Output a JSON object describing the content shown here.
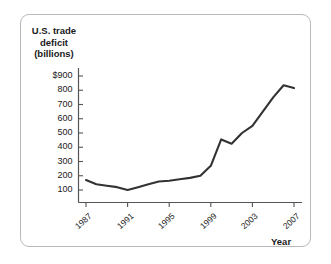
{
  "figure": {
    "border_color": "#b9b9b9",
    "background": "#ffffff",
    "line_color": "#333333",
    "axis_color": "#555555"
  },
  "axis_titles": {
    "y_line1": "U.S. trade",
    "y_line2": "deficit",
    "y_line3": "(billions)",
    "x": "Year"
  },
  "chart_data": {
    "type": "line",
    "title": "",
    "subtitle": "",
    "xlabel": "Year",
    "ylabel": "U.S. trade deficit (billions)",
    "xlim": [
      1986,
      2008
    ],
    "ylim": [
      0,
      950
    ],
    "grid": false,
    "legend": null,
    "x_tick_labels": [
      "1987",
      "1991",
      "1995",
      "1999",
      "2003",
      "2007"
    ],
    "x_tick_values": [
      1987,
      1991,
      1995,
      1999,
      2003,
      2007
    ],
    "y_tick_labels": [
      "$900",
      "800",
      "700",
      "600",
      "500",
      "400",
      "300",
      "200",
      "100"
    ],
    "y_tick_values": [
      900,
      800,
      700,
      600,
      500,
      400,
      300,
      200,
      100
    ],
    "series": [
      {
        "name": "U.S. trade deficit",
        "x": [
          1987,
          1988,
          1989,
          1990,
          1991,
          1992,
          1993,
          1994,
          1995,
          1996,
          1997,
          1998,
          1999,
          2000,
          2001,
          2002,
          2003,
          2004,
          2005,
          2006,
          2007
        ],
        "values": [
          170,
          140,
          130,
          120,
          100,
          120,
          140,
          160,
          165,
          175,
          185,
          200,
          270,
          455,
          425,
          500,
          550,
          650,
          750,
          835,
          815
        ]
      }
    ]
  }
}
